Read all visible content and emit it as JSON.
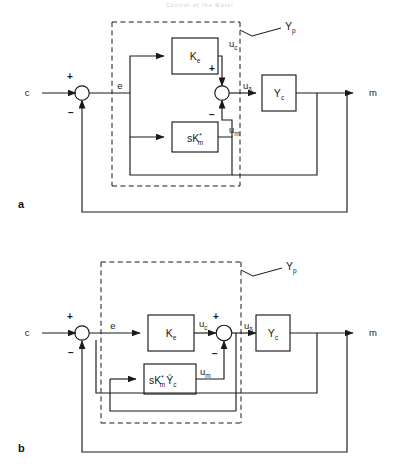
{
  "header": {
    "running_head": "Control of the Motor"
  },
  "figure": {
    "panels": [
      {
        "id": "a",
        "label": "a",
        "group_label": "Y",
        "group_label_sub": "p",
        "signals": {
          "input": "c",
          "error": "e",
          "controller_out": "u",
          "controller_out_sub": "c",
          "model_out": "u",
          "model_out_sub": "m",
          "delta": "u",
          "delta_sub": "δ",
          "output": "m"
        },
        "blocks": [
          {
            "name": "gain-block",
            "main": "K",
            "sub": "e",
            "sup": ""
          },
          {
            "name": "model-block",
            "main": "sK",
            "sub": "m",
            "sup": "*"
          },
          {
            "name": "plant-block",
            "main": "Y",
            "sub": "c",
            "sup": ""
          }
        ],
        "summing_junctions": [
          {
            "name": "error-sum",
            "signs": [
              "+",
              "−"
            ]
          },
          {
            "name": "inner-sum",
            "signs": [
              "+",
              "−"
            ]
          }
        ]
      },
      {
        "id": "b",
        "label": "b",
        "group_label": "Y",
        "group_label_sub": "p",
        "signals": {
          "input": "c",
          "error": "e",
          "controller_out": "u",
          "controller_out_sub": "c",
          "model_out": "u",
          "model_out_sub": "m",
          "delta": "u",
          "delta_sub": "δ",
          "output": "m"
        },
        "blocks": [
          {
            "name": "gain-block",
            "main": "K",
            "sub": "e",
            "sup": ""
          },
          {
            "name": "model-block",
            "main": "sK",
            "sub": "m",
            "sup": "*",
            "main2": "Ŷ",
            "sub2": "c"
          },
          {
            "name": "plant-block",
            "main": "Y",
            "sub": "c",
            "sup": ""
          }
        ],
        "summing_junctions": [
          {
            "name": "error-sum",
            "signs": [
              "+",
              "−"
            ]
          },
          {
            "name": "inner-sum",
            "signs": [
              "+",
              "−"
            ]
          }
        ]
      }
    ],
    "colors": {
      "line": "#1a1a1a",
      "dashed": "#1a1a1a",
      "text": "#1a1a1a",
      "background": "#ffffff"
    }
  }
}
